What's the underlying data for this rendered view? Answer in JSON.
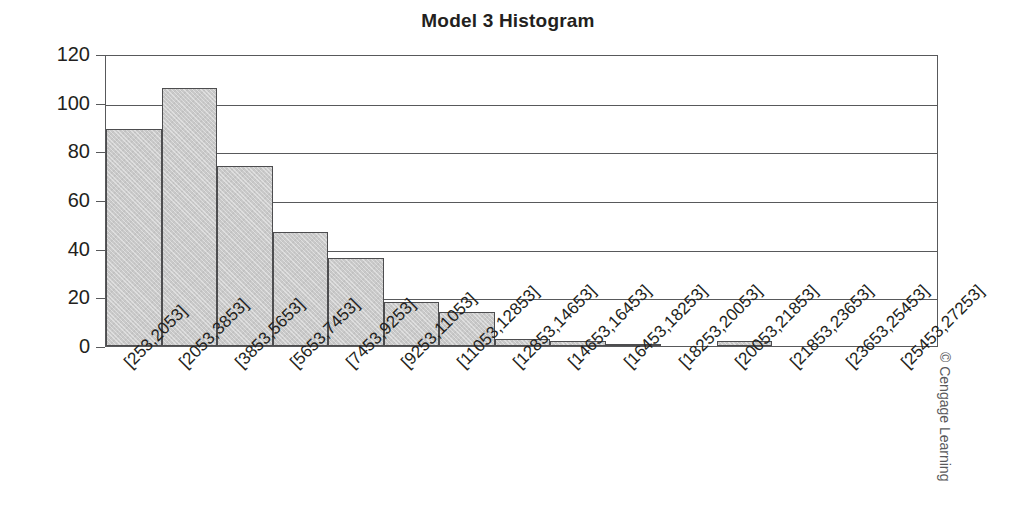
{
  "chart_data": {
    "type": "bar",
    "title": "Model 3 Histogram",
    "xlabel": "",
    "ylabel": "",
    "ylim": [
      0,
      120
    ],
    "ytick_step": 20,
    "yticks": [
      "0",
      "20",
      "40",
      "60",
      "80",
      "100",
      "120"
    ],
    "grid": true,
    "legend": false,
    "bar_fill_color": "#c9c9c9",
    "bar_border_color": "#4d4d4f",
    "axis_color": "#58595b",
    "text_color": "#231f20",
    "categories": [
      "[253,2053]",
      "[2053,3853]",
      "[3853,5653]",
      "[5653,7453]",
      "[7453,9253]",
      "[9253,11053]",
      "[11053,12853]",
      "[12853,14653]",
      "[14653,16453]",
      "[16453,18253]",
      "[18253,20053]",
      "[20053,21853]",
      "[21853,23653]",
      "[23653,25453]",
      "[25453,27253]"
    ],
    "values": [
      89,
      106,
      74,
      47,
      36,
      18,
      14,
      3,
      2,
      1,
      0,
      2,
      0,
      0,
      0
    ]
  },
  "footer": {
    "copyright": "© Cengage Learning"
  }
}
